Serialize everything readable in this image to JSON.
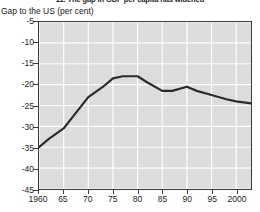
{
  "chart_data": {
    "type": "line",
    "title": "11. The gap in GDP per capita has widened",
    "ylabel": "Gap to the US (per cent)",
    "xlabel": "",
    "ylim": [
      -45,
      -5
    ],
    "xlim": [
      1960,
      2003
    ],
    "grid": true,
    "legend": null,
    "yticks": [
      -5,
      -10,
      -15,
      -20,
      -25,
      -30,
      -35,
      -40,
      -45
    ],
    "ytick_labels": [
      "-5",
      "-10",
      "-15",
      "-20",
      "-25",
      "-30",
      "-35",
      "-40",
      "-45"
    ],
    "xticks": [
      1960,
      1965,
      1970,
      1975,
      1980,
      1985,
      1990,
      1995,
      2000
    ],
    "xtick_labels": [
      "1960",
      "65",
      "70",
      "75",
      "80",
      "85",
      "90",
      "95",
      "2000"
    ],
    "line_color": "#2b2b2b",
    "plot_background": "#dcdcdc",
    "gridline_color": "#ffffff",
    "series": [
      {
        "name": "Gap to the US (per cent)",
        "x": [
          1960,
          1962,
          1965,
          1967,
          1970,
          1973,
          1975,
          1977,
          1980,
          1982,
          1985,
          1987,
          1990,
          1992,
          1995,
          1998,
          2000,
          2003
        ],
        "values": [
          -35.0,
          -33.0,
          -30.5,
          -27.5,
          -23.0,
          -20.5,
          -18.5,
          -18.0,
          -18.0,
          -19.5,
          -21.5,
          -21.5,
          -20.5,
          -21.5,
          -22.5,
          -23.5,
          -24.0,
          -24.5
        ]
      }
    ]
  }
}
